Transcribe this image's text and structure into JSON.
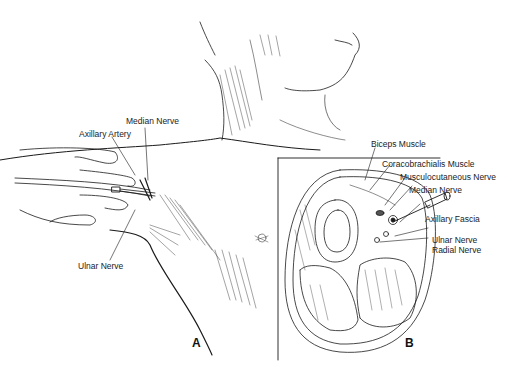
{
  "figure": {
    "panel_a": {
      "letter": "A",
      "labels": {
        "median_nerve": "Median Nerve",
        "axillary_artery": "Axillary Artery",
        "ulnar_nerve": "Ulnar Nerve"
      }
    },
    "panel_b": {
      "letter": "B",
      "labels": {
        "biceps_muscle": "Biceps Muscle",
        "coracobrachialis_muscle": "Coracobrachialis Muscle",
        "musculocutaneous_nerve": "Musculocutaneous Nerve",
        "median_nerve": "Median Nerve",
        "axillary_fascia": "Axillary Fascia",
        "ulnar_nerve": "Ulnar Nerve",
        "radial_nerve": "Radial Nerve"
      }
    },
    "colors": {
      "ink": "#1a1a1a",
      "background": "#ffffff"
    }
  }
}
